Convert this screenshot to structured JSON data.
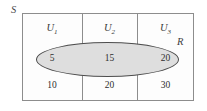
{
  "diagram": {
    "sample_space_label": "S",
    "event_label": "R",
    "colors": {
      "event_fill": "#dedede",
      "event_stroke": "#4d4d4d",
      "frame_stroke": "#8d8d8d",
      "background": "#fdfdfd",
      "text": "#2e2e2e"
    },
    "partitions": [
      {
        "label": "U",
        "subscript": "1",
        "in_event": "5",
        "out_event": "10"
      },
      {
        "label": "U",
        "subscript": "2",
        "in_event": "15",
        "out_event": "20"
      },
      {
        "label": "U",
        "subscript": "3",
        "in_event": "20",
        "out_event": "30"
      }
    ]
  }
}
